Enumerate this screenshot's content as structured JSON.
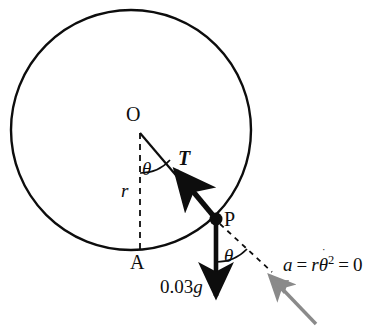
{
  "figure": {
    "type": "physics-free-body-diagram",
    "background_color": "#ffffff",
    "stroke_color": "#0d0d0d",
    "cursor_color": "#8a8a8a",
    "labels": {
      "center_point": "O",
      "bottom_point": "A",
      "mass_point": "P",
      "tension": "T",
      "radius": "r",
      "angle_at_center": "θ",
      "angle_at_point": "θ",
      "weight_value": "0.03",
      "weight_symbol": "g",
      "acceleration": {
        "lhs": "a",
        "equals_1": "=",
        "radius_symbol": "r",
        "theta_symbol": "θ",
        "theta_dot": "˙",
        "theta_exponent": "2",
        "equals_2": "=",
        "rhs": "0",
        "full_text": "a = rθ̇² = 0"
      }
    },
    "geometry": {
      "circle": {
        "cx": 131,
        "cy": 130,
        "r": 120
      },
      "center_O": {
        "x": 140,
        "y": 133
      },
      "point_P": {
        "x": 216,
        "y": 219
      },
      "point_A": {
        "x": 140,
        "y": 250
      },
      "tension_arrow": {
        "from_x": 216,
        "from_y": 219,
        "to_x": 171,
        "to_y": 165
      },
      "weight_arrow": {
        "from_x": 216,
        "from_y": 219,
        "to_x": 216,
        "to_y": 302
      },
      "accel_dashed": {
        "from_x": 219,
        "from_y": 223,
        "to_x": 272,
        "to_y": 272
      },
      "radius_dashed": {
        "from_x": 140,
        "from_y": 133,
        "to_x": 140,
        "to_y": 252
      },
      "cursor_arrow": {
        "from_x": 316,
        "from_y": 324,
        "to_x": 264,
        "to_y": 270
      }
    }
  }
}
